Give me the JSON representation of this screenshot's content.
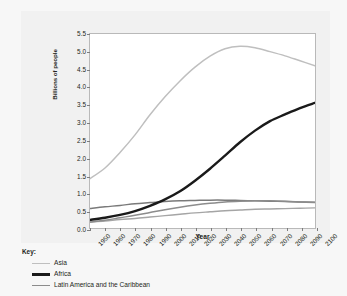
{
  "figure": {
    "background_color": "#f7f7f7",
    "plot_background_color": "#ffffff",
    "frame_color": "#b9b9b9"
  },
  "axes": {
    "ylabel": "Billions of people",
    "xlabel": "Year",
    "yticks": [
      "5.5",
      "5.0",
      "4.5",
      "4.0",
      "3.5",
      "3.0",
      "2.5",
      "2.0",
      "1.5",
      "1.0",
      "0.5",
      "0.0"
    ],
    "xticks": [
      "1950",
      "1960",
      "1970",
      "1980",
      "1990",
      "2000",
      "2010",
      "2020",
      "2030",
      "2040",
      "2050",
      "2060",
      "2070",
      "2080",
      "2090",
      "2100"
    ]
  },
  "legend": {
    "title": "Key:",
    "entries": [
      {
        "label": "Asia",
        "color": "#bfbfbf",
        "width": 1.6
      },
      {
        "label": "Africa",
        "color": "#1a1a1a",
        "width": 2.6
      },
      {
        "label": "Latin America and the Caribbean",
        "color": "#8c8c8c",
        "width": 1.8
      }
    ]
  },
  "chart_data": {
    "type": "line",
    "title": "",
    "xlabel": "Year",
    "ylabel": "Billions of people",
    "xlim": [
      1950,
      2100
    ],
    "ylim": [
      0.0,
      5.5
    ],
    "ytick_step": 0.5,
    "xtick_step": 10,
    "grid": false,
    "legend_position": "below-plot",
    "x": [
      1950,
      1960,
      1970,
      1980,
      1990,
      2000,
      2010,
      2020,
      2030,
      2040,
      2050,
      2060,
      2070,
      2080,
      2090,
      2100
    ],
    "series": [
      {
        "name": "Asia",
        "color": "#bfbfbf",
        "values": [
          1.4,
          1.7,
          2.14,
          2.64,
          3.21,
          3.72,
          4.17,
          4.56,
          4.87,
          5.08,
          5.15,
          5.11,
          5.0,
          4.88,
          4.74,
          4.6
        ]
      },
      {
        "name": "Africa",
        "color": "#1a1a1a",
        "values": [
          0.23,
          0.29,
          0.37,
          0.48,
          0.63,
          0.81,
          1.04,
          1.34,
          1.68,
          2.05,
          2.43,
          2.76,
          3.03,
          3.22,
          3.4,
          3.55
        ]
      },
      {
        "name": "Latin America and the Caribbean",
        "color": "#8c8c8c",
        "values": [
          0.17,
          0.22,
          0.29,
          0.36,
          0.44,
          0.52,
          0.59,
          0.65,
          0.7,
          0.74,
          0.76,
          0.77,
          0.77,
          0.76,
          0.74,
          0.72
        ]
      },
      {
        "name": "unlabelled-region-upper",
        "color": "#7a7a7a",
        "values": [
          0.55,
          0.6,
          0.64,
          0.69,
          0.72,
          0.75,
          0.77,
          0.78,
          0.79,
          0.79,
          0.78,
          0.77,
          0.76,
          0.75,
          0.74,
          0.73
        ]
      },
      {
        "name": "unlabelled-region-lower",
        "color": "#a5a5a5",
        "values": [
          0.17,
          0.2,
          0.24,
          0.27,
          0.31,
          0.35,
          0.39,
          0.43,
          0.46,
          0.49,
          0.51,
          0.53,
          0.54,
          0.55,
          0.56,
          0.57
        ]
      }
    ]
  }
}
